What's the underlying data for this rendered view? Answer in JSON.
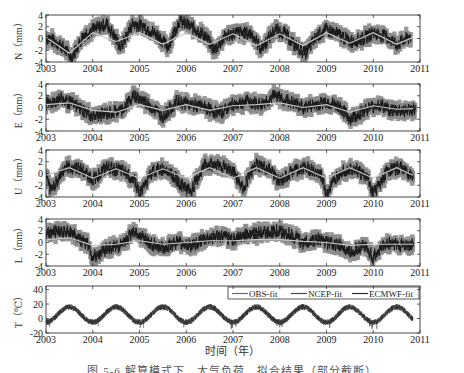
{
  "chart_data": [
    {
      "type": "line",
      "panel": "N",
      "ylabel": "N（mm）",
      "ylim": [
        -4,
        4
      ],
      "yticks": [
        4,
        2,
        0,
        -2,
        -4
      ],
      "xlim": [
        2003,
        2011
      ],
      "xticks": [
        2003,
        2004,
        2005,
        2006,
        2007,
        2008,
        2009,
        2010,
        2011
      ],
      "description": "GPS North residual time series with error bars (grey) and fitted annual signal (light line)",
      "series": [
        {
          "name": "observed",
          "x": [
            2003.0,
            2003.3,
            2003.55,
            2003.8,
            2004.0,
            2004.3,
            2004.6,
            2004.85,
            2005.1,
            2005.4,
            2005.6,
            2005.85,
            2006.1,
            2006.4,
            2006.6,
            2006.85,
            2007.1,
            2007.4,
            2007.6,
            2007.9,
            2008.1,
            2008.3,
            2008.55,
            2008.8,
            2009.0,
            2009.3,
            2009.5,
            2009.8,
            2010.0,
            2010.3,
            2010.5,
            2010.8
          ],
          "values": [
            0.2,
            -1.0,
            -3.2,
            0.5,
            1.5,
            2.5,
            -1.5,
            2.5,
            2.0,
            0.5,
            -1.5,
            3.0,
            2.0,
            0.5,
            -2.0,
            0.5,
            1.0,
            0.8,
            -1.8,
            1.5,
            1.0,
            -1.0,
            -2.5,
            0.5,
            1.5,
            0.5,
            -0.5,
            0.0,
            1.0,
            0.2,
            -1.0,
            0.3
          ]
        },
        {
          "name": "fit",
          "x": [
            2003.0,
            2003.5,
            2004.0,
            2004.5,
            2005.0,
            2005.5,
            2006.0,
            2006.5,
            2007.0,
            2007.5,
            2008.0,
            2008.5,
            2009.0,
            2009.5,
            2010.0,
            2010.5,
            2010.85
          ],
          "values": [
            0.2,
            -2.5,
            1.0,
            -0.5,
            1.0,
            -1.0,
            1.0,
            -1.0,
            0.8,
            -1.2,
            0.8,
            -1.2,
            1.0,
            -0.8,
            1.0,
            -1.0,
            0.2
          ]
        }
      ]
    },
    {
      "type": "line",
      "panel": "E",
      "ylabel": "E（mm）",
      "ylim": [
        -4,
        4
      ],
      "yticks": [
        4,
        2,
        0,
        -2,
        -4
      ],
      "xlim": [
        2003,
        2011
      ],
      "xticks": [
        2003,
        2004,
        2005,
        2006,
        2007,
        2008,
        2009,
        2010,
        2011
      ],
      "series": [
        {
          "name": "observed",
          "x": [
            2003.0,
            2003.3,
            2003.6,
            2004.0,
            2004.3,
            2004.6,
            2004.9,
            2005.2,
            2005.5,
            2005.8,
            2006.1,
            2006.4,
            2006.7,
            2007.0,
            2007.3,
            2007.6,
            2007.9,
            2008.2,
            2008.5,
            2008.8,
            2009.0,
            2009.3,
            2009.5,
            2009.8,
            2010.1,
            2010.4,
            2010.7,
            2010.9
          ],
          "values": [
            0.5,
            1.5,
            0.5,
            -1.5,
            -1.0,
            -0.5,
            2.0,
            0.5,
            -1.5,
            1.0,
            0.5,
            0.0,
            -1.0,
            0.5,
            1.0,
            0.5,
            2.0,
            1.0,
            0.0,
            0.5,
            1.0,
            0.0,
            -2.0,
            -0.5,
            0.5,
            -0.5,
            -0.5,
            -0.3
          ]
        },
        {
          "name": "fit",
          "x": [
            2003.0,
            2003.5,
            2004.0,
            2004.5,
            2005.0,
            2005.5,
            2006.0,
            2006.5,
            2007.0,
            2007.5,
            2008.0,
            2008.5,
            2009.0,
            2009.5,
            2010.0,
            2010.5,
            2010.85
          ],
          "values": [
            0.5,
            0.8,
            -0.5,
            -0.8,
            0.5,
            -0.5,
            0.5,
            -0.5,
            0.3,
            0.5,
            0.8,
            0.0,
            0.5,
            -0.8,
            0.3,
            -0.3,
            -0.2
          ]
        }
      ]
    },
    {
      "type": "line",
      "panel": "U",
      "ylabel": "U（mm）",
      "ylim": [
        -4,
        4
      ],
      "yticks": [
        4,
        2,
        0,
        -2,
        -4
      ],
      "xlim": [
        2003,
        2011
      ],
      "xticks": [
        2003,
        2004,
        2005,
        2006,
        2007,
        2008,
        2009,
        2010,
        2011
      ],
      "series": [
        {
          "name": "observed",
          "x": [
            2003.0,
            2003.1,
            2003.4,
            2003.7,
            2004.0,
            2004.3,
            2004.6,
            2004.9,
            2005.0,
            2005.3,
            2005.6,
            2005.9,
            2006.1,
            2006.4,
            2006.7,
            2007.0,
            2007.2,
            2007.5,
            2007.8,
            2008.0,
            2008.3,
            2008.6,
            2008.9,
            2009.0,
            2009.3,
            2009.6,
            2009.9,
            2010.0,
            2010.3,
            2010.6,
            2010.85
          ],
          "values": [
            -0.5,
            -3.0,
            1.0,
            1.0,
            -1.0,
            1.0,
            0.5,
            -1.0,
            -3.5,
            0.5,
            0.8,
            -2.0,
            -3.0,
            1.5,
            1.5,
            0.5,
            -2.5,
            1.5,
            0.5,
            -1.5,
            0.5,
            1.0,
            -0.5,
            -3.5,
            0.5,
            1.0,
            -1.0,
            -3.5,
            0.5,
            1.0,
            -0.5
          ]
        },
        {
          "name": "fit",
          "x": [
            2003.0,
            2003.5,
            2004.0,
            2004.5,
            2005.0,
            2005.5,
            2006.0,
            2006.5,
            2007.0,
            2007.5,
            2008.0,
            2008.5,
            2009.0,
            2009.5,
            2010.0,
            2010.5,
            2010.85
          ],
          "values": [
            -0.3,
            1.0,
            -0.8,
            0.8,
            -0.8,
            0.8,
            -0.8,
            1.0,
            -0.8,
            1.0,
            -0.8,
            1.0,
            -0.8,
            1.0,
            -0.8,
            1.0,
            -0.3
          ]
        }
      ]
    },
    {
      "type": "line",
      "panel": "L",
      "ylabel": "L（mm）",
      "ylim": [
        -4,
        4
      ],
      "yticks": [
        4,
        2,
        0,
        -2,
        -4
      ],
      "xlim": [
        2003,
        2011
      ],
      "xticks": [
        2003,
        2004,
        2005,
        2006,
        2007,
        2008,
        2009,
        2010,
        2011
      ],
      "series": [
        {
          "name": "observed",
          "x": [
            2003.0,
            2003.3,
            2003.6,
            2003.9,
            2004.0,
            2004.3,
            2004.6,
            2004.9,
            2005.2,
            2005.5,
            2005.8,
            2006.1,
            2006.4,
            2006.7,
            2007.0,
            2007.3,
            2007.6,
            2007.9,
            2008.2,
            2008.5,
            2008.8,
            2009.0,
            2009.3,
            2009.5,
            2009.8,
            2010.0,
            2010.3,
            2010.6,
            2010.85
          ],
          "values": [
            1.5,
            2.0,
            1.5,
            -0.5,
            -2.5,
            -1.0,
            -0.5,
            2.0,
            0.0,
            -1.0,
            0.0,
            -0.5,
            0.5,
            1.0,
            0.5,
            1.5,
            1.5,
            2.0,
            1.5,
            0.0,
            0.5,
            0.0,
            -0.5,
            -1.5,
            -0.5,
            -2.5,
            0.0,
            -0.5,
            -0.5
          ]
        },
        {
          "name": "fit",
          "x": [
            2003.0,
            2003.5,
            2004.0,
            2004.5,
            2005.0,
            2005.5,
            2006.0,
            2006.5,
            2007.0,
            2007.5,
            2008.0,
            2008.5,
            2009.0,
            2009.5,
            2010.0,
            2010.5,
            2010.85
          ],
          "values": [
            0.5,
            0.8,
            -0.5,
            -0.3,
            0.3,
            -0.3,
            0.0,
            0.3,
            0.3,
            0.5,
            0.5,
            0.2,
            0.0,
            -0.5,
            -0.3,
            -0.3,
            -0.3
          ]
        }
      ]
    },
    {
      "type": "line",
      "panel": "T",
      "ylabel": "T（℃）",
      "ylim": [
        -20,
        45
      ],
      "yticks": [
        40,
        20,
        0,
        -20
      ],
      "xlim": [
        2003,
        2011
      ],
      "xticks": [
        2003,
        2004,
        2005,
        2006,
        2007,
        2008,
        2009,
        2010,
        2011
      ],
      "legend": {
        "position": "upper right",
        "entries": [
          "OBS-fit",
          "NCEP-fit",
          "ECMWF-fit"
        ]
      },
      "description": "Annual temperature cycle, peaks ~mid-year near 20°C, troughs ~start of year near -5 to -15°C",
      "series": [
        {
          "name": "OBS-fit",
          "x": [
            2003.0,
            2003.5,
            2004.0,
            2004.5,
            2005.0,
            2005.5,
            2006.0,
            2006.5,
            2007.0,
            2007.5,
            2008.0,
            2008.5,
            2009.0,
            2009.5,
            2010.0,
            2010.5,
            2010.85
          ],
          "values": [
            -5,
            17,
            -5,
            15,
            -5,
            16,
            -5,
            16,
            -5,
            16,
            -5,
            16,
            -5,
            16,
            -5,
            16,
            5
          ]
        },
        {
          "name": "NCEP-fit",
          "x": [
            2003.0,
            2003.5,
            2004.0,
            2004.5,
            2005.0,
            2005.5,
            2006.0,
            2006.5,
            2007.0,
            2007.5,
            2008.0,
            2008.5,
            2009.0,
            2009.5,
            2010.0,
            2010.5,
            2010.85
          ],
          "values": [
            -5,
            16,
            -5,
            15,
            -5,
            15,
            -5,
            15,
            -5,
            15,
            -5,
            15,
            -5,
            15,
            -5,
            15,
            5
          ]
        },
        {
          "name": "ECMWF-fit",
          "x": [
            2003.0,
            2003.5,
            2004.0,
            2004.5,
            2005.0,
            2005.5,
            2006.0,
            2006.5,
            2007.0,
            2007.5,
            2008.0,
            2008.5,
            2009.0,
            2009.5,
            2010.0,
            2010.5,
            2010.85
          ],
          "values": [
            -5,
            16,
            -5,
            15,
            -5,
            15,
            -5,
            15,
            -5,
            15,
            -5,
            15,
            -5,
            15,
            -5,
            15,
            5
          ]
        }
      ]
    }
  ],
  "xaxis_label": "时间（年）",
  "caption": "图 5-6  解算模式下…大气负荷…拟合结果（部分截断）",
  "colors": {
    "errorbar": "#8a8a8a",
    "observed": "#1a1a1a",
    "fit": "#c8c8c8",
    "axis": "#333333",
    "temperature": "#555555"
  }
}
